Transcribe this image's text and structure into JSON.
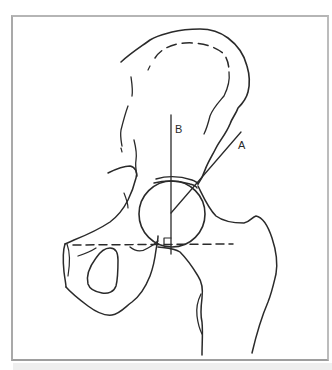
{
  "diagram": {
    "labels": {
      "line_a": "A",
      "line_b": "B"
    },
    "elements": [
      {
        "name": "ilium-outline",
        "style": "solid"
      },
      {
        "name": "iliac-crest-inner-contour",
        "style": "dashed"
      },
      {
        "name": "femoral-head",
        "style": "solid circle"
      },
      {
        "name": "line-b-vertical",
        "style": "solid"
      },
      {
        "name": "line-a-oblique",
        "style": "solid"
      },
      {
        "name": "horizontal-reference-line",
        "style": "dashed"
      },
      {
        "name": "right-angle-marker",
        "style": "solid"
      },
      {
        "name": "obturator-foramen",
        "style": "solid"
      },
      {
        "name": "femur-outline",
        "style": "solid"
      }
    ],
    "colors": {
      "ink": "#2a2a2a",
      "frame": "#a9a9a9",
      "background": "#ffffff",
      "bottom_strip": "#efefef"
    }
  }
}
